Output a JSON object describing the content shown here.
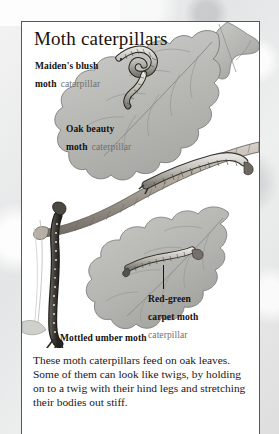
{
  "plate": {
    "title": "Moth caterpillars",
    "labels": [
      {
        "id": "maidens-blush",
        "bold": "Maiden's blush",
        "bold2": "moth",
        "light": "caterpillar"
      },
      {
        "id": "oak-beauty",
        "bold": "Oak beauty",
        "bold2": "moth",
        "light": "caterpillar"
      },
      {
        "id": "red-green-carpet",
        "bold": "Red-green",
        "bold2": "carpet moth",
        "light": "caterpillar"
      },
      {
        "id": "mottled-umber",
        "bold": "Mottled umber moth",
        "bold2": "",
        "light": "caterpillar"
      }
    ],
    "caption": "These moth caterpillars feed on oak leaves. Some of them can look like twigs, by holding on to a twig with their hind legs and stretching their bodies out stiff.",
    "colors": {
      "frame": "#55585b",
      "ink": "#17120e",
      "label_light": "#6f6f6d",
      "page_background": "#e9eaea",
      "plate_background": "#ffffff"
    }
  }
}
